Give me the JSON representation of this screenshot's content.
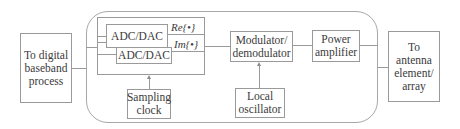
{
  "diagram": {
    "type": "block-diagram",
    "blocks": {
      "baseband": "To digital baseband process",
      "adc_dac_top": "ADC/DAC",
      "adc_dac_bottom": "ADC/DAC",
      "sampling_clock": "Sampling clock",
      "modulator": "Modulator/ demodulator",
      "local_oscillator": "Local oscillator",
      "power_amplifier": "Power amplifier",
      "antenna": "To antenna element/ array"
    },
    "signals": {
      "real": "Re{•}",
      "imag": "Im{•}"
    },
    "edges": [
      [
        "baseband",
        "adc_dac_group"
      ],
      [
        "adc_dac_group",
        "modulator"
      ],
      [
        "sampling_clock",
        "adc_dac_group"
      ],
      [
        "local_oscillator",
        "modulator"
      ],
      [
        "modulator",
        "power_amplifier"
      ],
      [
        "power_amplifier",
        "antenna"
      ]
    ]
  }
}
